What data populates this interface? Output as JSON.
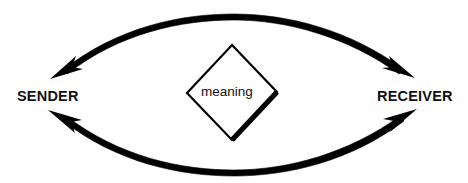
{
  "diagram": {
    "type": "communication-model",
    "background_color": "#ffffff",
    "stroke_color": "#000000",
    "canvas": {
      "width": 468,
      "height": 183
    },
    "nodes": {
      "sender": {
        "label": "SENDER",
        "x": 17,
        "y": 89
      },
      "receiver": {
        "label": "RECEIVER",
        "x": 377,
        "y": 89
      },
      "meaning": {
        "label": "meaning",
        "x": 201,
        "y": 85
      }
    },
    "shapes": {
      "diamond": {
        "name": "meaning-diamond",
        "top": {
          "x": 232,
          "y": 45
        },
        "right": {
          "x": 277,
          "y": 92
        },
        "bottom": {
          "x": 232,
          "y": 140
        },
        "left": {
          "x": 187,
          "y": 93
        },
        "stroke_width": 2,
        "shadow_edge": "bottom-right",
        "shadow_stroke_width": 5
      }
    },
    "arrows": [
      {
        "name": "sender-to-receiver-arc",
        "direction": "left-to-right",
        "position": "top",
        "start": {
          "x": 52,
          "y": 77
        },
        "apex": {
          "x": 234,
          "y": 16
        },
        "end": {
          "x": 412,
          "y": 75
        },
        "arrowheads": [
          "start",
          "end"
        ],
        "stroke_width": 3
      },
      {
        "name": "receiver-to-sender-arc",
        "direction": "right-to-left",
        "position": "bottom",
        "start": {
          "x": 50,
          "y": 113
        },
        "nadir": {
          "x": 234,
          "y": 169
        },
        "end": {
          "x": 415,
          "y": 112
        },
        "arrowheads": [
          "start",
          "end"
        ],
        "stroke_width": 3
      }
    ]
  }
}
